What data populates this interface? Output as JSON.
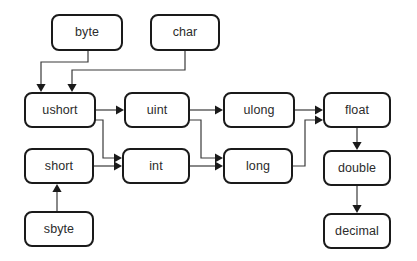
{
  "diagram": {
    "background_color": "#ffffff",
    "node_fill": "#ffffff",
    "node_stroke": "#1a1a1a",
    "text_color": "#2b2b2b",
    "edge_color": "#3a3a3a",
    "nodes": [
      {
        "id": "byte",
        "label": "byte",
        "x": 52,
        "y": 15,
        "w": 70,
        "h": 35
      },
      {
        "id": "char",
        "label": "char",
        "x": 151,
        "y": 15,
        "w": 68,
        "h": 35
      },
      {
        "id": "ushort",
        "label": "ushort",
        "x": 25,
        "y": 93,
        "w": 70,
        "h": 34
      },
      {
        "id": "uint",
        "label": "uint",
        "x": 125,
        "y": 93,
        "w": 64,
        "h": 34
      },
      {
        "id": "ulong",
        "label": "ulong",
        "x": 224,
        "y": 93,
        "w": 70,
        "h": 34
      },
      {
        "id": "float",
        "label": "float",
        "x": 324,
        "y": 93,
        "w": 66,
        "h": 34
      },
      {
        "id": "short",
        "label": "short",
        "x": 25,
        "y": 149,
        "w": 68,
        "h": 34
      },
      {
        "id": "int",
        "label": "int",
        "x": 123,
        "y": 149,
        "w": 66,
        "h": 34
      },
      {
        "id": "long",
        "label": "long",
        "x": 224,
        "y": 149,
        "w": 68,
        "h": 34
      },
      {
        "id": "double",
        "label": "double",
        "x": 324,
        "y": 151,
        "w": 66,
        "h": 34
      },
      {
        "id": "sbyte",
        "label": "sbyte",
        "x": 25,
        "y": 212,
        "w": 68,
        "h": 34
      },
      {
        "id": "decimal",
        "label": "decimal",
        "x": 324,
        "y": 214,
        "w": 66,
        "h": 34
      }
    ],
    "edges": [
      {
        "id": "byte-ushort",
        "from": "byte",
        "to": "ushort",
        "points": "88,50 88,62 41,62 41,86",
        "arrow": "down",
        "tip": "41,92"
      },
      {
        "id": "char-ushort",
        "from": "char",
        "to": "ushort",
        "points": "185,50 185,70 72,70 72,86",
        "arrow": "down",
        "tip": "72,92"
      },
      {
        "id": "ushort-uint",
        "from": "ushort",
        "to": "uint",
        "points": "95,110 118,110",
        "arrow": "right",
        "tip": "124,110"
      },
      {
        "id": "ushort-int",
        "from": "ushort",
        "to": "int",
        "points": "95,120 103,120 103,158 116,158",
        "arrow": "right",
        "tip": "122,158"
      },
      {
        "id": "short-int",
        "from": "short",
        "to": "int",
        "points": "93,166 116,166",
        "arrow": "right",
        "tip": "122,166"
      },
      {
        "id": "sbyte-short",
        "from": "sbyte",
        "to": "short",
        "points": "57,212 57,190",
        "arrow": "up",
        "tip": "57,184"
      },
      {
        "id": "uint-ulong",
        "from": "uint",
        "to": "ulong",
        "points": "189,110 217,110",
        "arrow": "right",
        "tip": "223,110"
      },
      {
        "id": "uint-long",
        "from": "uint",
        "to": "long",
        "points": "189,120 201,120 201,158 217,158",
        "arrow": "right",
        "tip": "223,158"
      },
      {
        "id": "int-long",
        "from": "int",
        "to": "long",
        "points": "189,166 217,166",
        "arrow": "right",
        "tip": "223,166"
      },
      {
        "id": "ulong-float",
        "from": "ulong",
        "to": "float",
        "points": "294,110 317,110",
        "arrow": "right",
        "tip": "323,110"
      },
      {
        "id": "long-float",
        "from": "long",
        "to": "float",
        "points": "292,166 305,166 305,120 317,120",
        "arrow": "right",
        "tip": "323,120"
      },
      {
        "id": "float-double",
        "from": "float",
        "to": "double",
        "points": "357,127 357,144",
        "arrow": "down",
        "tip": "357,150"
      },
      {
        "id": "double-decimal",
        "from": "double",
        "to": "decimal",
        "points": "357,185 357,207",
        "arrow": "down",
        "tip": "357,213"
      }
    ]
  }
}
